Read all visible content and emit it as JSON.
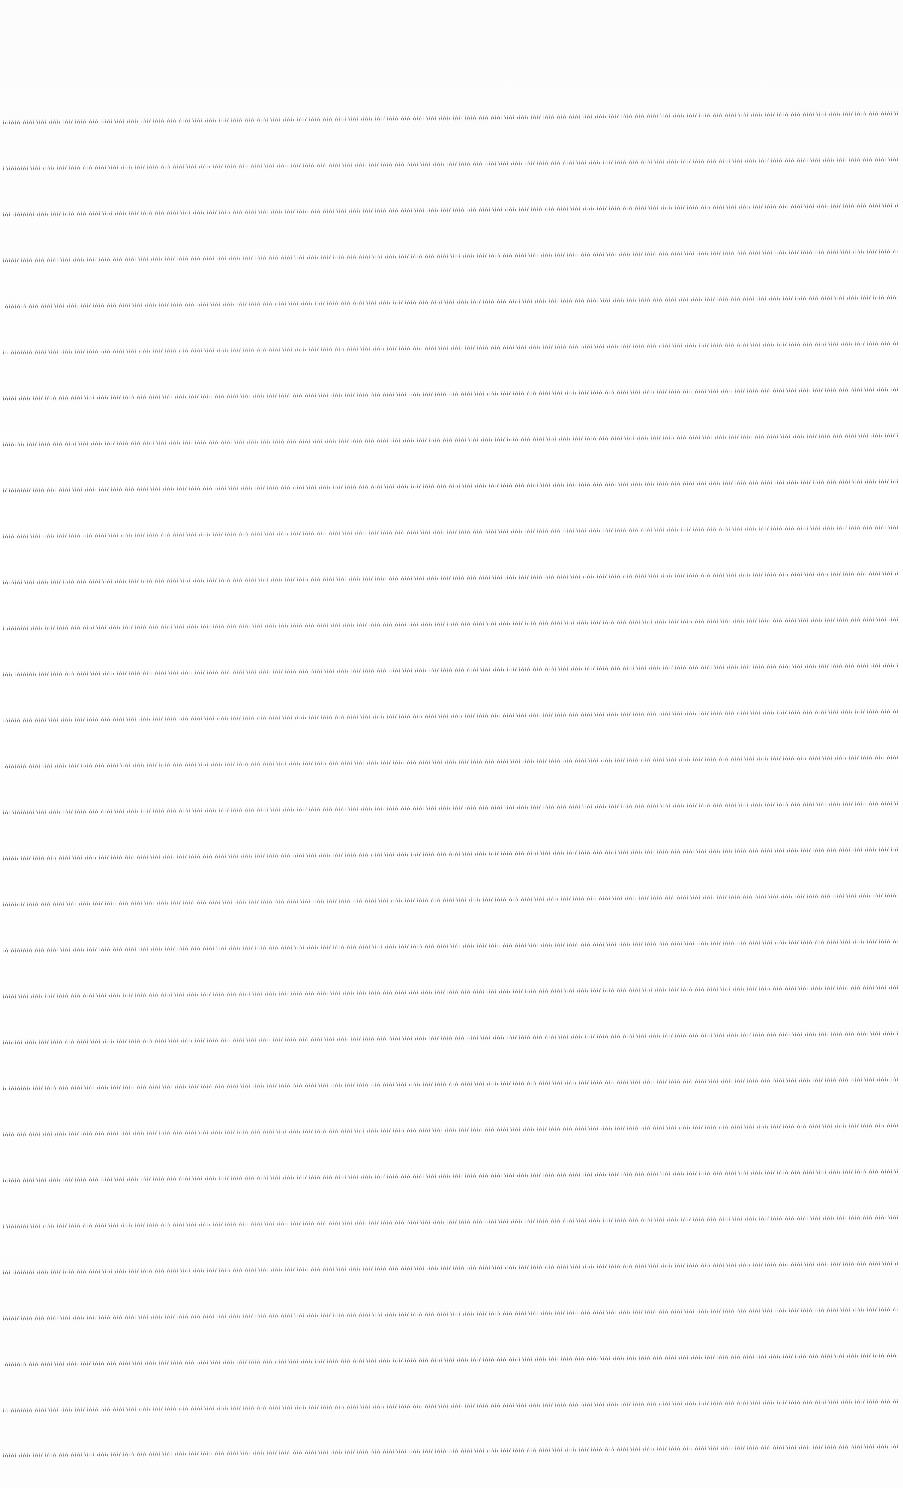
{
  "document": {
    "kind": "scanned-text-page",
    "page_background": "#ffffff",
    "ink_color": "#5a5c60",
    "body_text_legible": false,
    "body_text_note": "",
    "layout": {
      "page_width": 903,
      "page_height": 1488,
      "top_margin": 110,
      "bottom_margin": 26,
      "left_margin": 3,
      "right_margin": 5,
      "text_left": 3,
      "text_right": 898,
      "line_pitch": 46.0,
      "line_count": 30,
      "first_line_y": 122,
      "last_line_y": 1455,
      "skew_degrees": -0.576,
      "alignment": "justified",
      "columns": 1
    },
    "lines": [
      {
        "index": 1,
        "y": 122,
        "x_start": 3,
        "x_end": 898,
        "ink": 0.92
      },
      {
        "index": 2,
        "y": 168,
        "x_start": 3,
        "x_end": 898,
        "ink": 0.88
      },
      {
        "index": 3,
        "y": 214,
        "x_start": 3,
        "x_end": 898,
        "ink": 0.94
      },
      {
        "index": 4,
        "y": 260,
        "x_start": 3,
        "x_end": 898,
        "ink": 0.9
      },
      {
        "index": 5,
        "y": 306,
        "x_start": 3,
        "x_end": 898,
        "ink": 0.95
      },
      {
        "index": 6,
        "y": 352,
        "x_start": 3,
        "x_end": 898,
        "ink": 0.87
      },
      {
        "index": 7,
        "y": 398,
        "x_start": 3,
        "x_end": 898,
        "ink": 0.93
      },
      {
        "index": 8,
        "y": 444,
        "x_start": 3,
        "x_end": 898,
        "ink": 0.91
      },
      {
        "index": 9,
        "y": 490,
        "x_start": 3,
        "x_end": 898,
        "ink": 0.96
      },
      {
        "index": 10,
        "y": 536,
        "x_start": 3,
        "x_end": 898,
        "ink": 0.89
      },
      {
        "index": 11,
        "y": 582,
        "x_start": 3,
        "x_end": 898,
        "ink": 0.92
      },
      {
        "index": 12,
        "y": 628,
        "x_start": 3,
        "x_end": 898,
        "ink": 0.9
      },
      {
        "index": 13,
        "y": 674,
        "x_start": 3,
        "x_end": 898,
        "ink": 0.94
      },
      {
        "index": 14,
        "y": 720,
        "x_start": 3,
        "x_end": 898,
        "ink": 0.88
      },
      {
        "index": 15,
        "y": 766,
        "x_start": 3,
        "x_end": 898,
        "ink": 0.93
      },
      {
        "index": 16,
        "y": 812,
        "x_start": 3,
        "x_end": 898,
        "ink": 0.91
      },
      {
        "index": 17,
        "y": 858,
        "x_start": 3,
        "x_end": 898,
        "ink": 0.95
      },
      {
        "index": 18,
        "y": 904,
        "x_start": 3,
        "x_end": 898,
        "ink": 0.89
      },
      {
        "index": 19,
        "y": 950,
        "x_start": 3,
        "x_end": 898,
        "ink": 0.92
      },
      {
        "index": 20,
        "y": 996,
        "x_start": 3,
        "x_end": 898,
        "ink": 0.94
      },
      {
        "index": 21,
        "y": 1042,
        "x_start": 3,
        "x_end": 898,
        "ink": 0.9
      },
      {
        "index": 22,
        "y": 1088,
        "x_start": 3,
        "x_end": 898,
        "ink": 0.93
      },
      {
        "index": 23,
        "y": 1134,
        "x_start": 3,
        "x_end": 898,
        "ink": 0.88
      },
      {
        "index": 24,
        "y": 1180,
        "x_start": 3,
        "x_end": 898,
        "ink": 0.95
      },
      {
        "index": 25,
        "y": 1226,
        "x_start": 3,
        "x_end": 898,
        "ink": 0.91
      },
      {
        "index": 26,
        "y": 1272,
        "x_start": 3,
        "x_end": 898,
        "ink": 0.93
      },
      {
        "index": 27,
        "y": 1318,
        "x_start": 3,
        "x_end": 898,
        "ink": 0.9
      },
      {
        "index": 28,
        "y": 1364,
        "x_start": 3,
        "x_end": 898,
        "ink": 0.94
      },
      {
        "index": 29,
        "y": 1410,
        "x_start": 3,
        "x_end": 898,
        "ink": 0.89
      },
      {
        "index": 30,
        "y": 1455,
        "x_start": 3,
        "x_end": 898,
        "ink": 0.96
      }
    ]
  }
}
